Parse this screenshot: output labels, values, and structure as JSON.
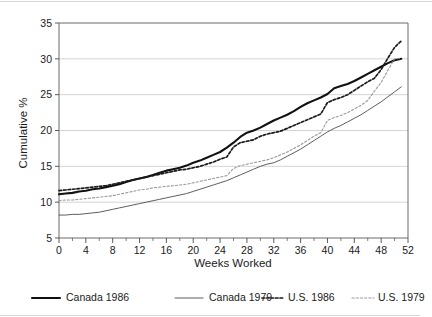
{
  "chart_data": {
    "type": "line",
    "title": "",
    "subtitle": "",
    "xlabel": "Weeks Worked",
    "ylabel": "Cumulative %",
    "xlim": [
      0,
      52
    ],
    "ylim": [
      5,
      35
    ],
    "grid": "horizontal",
    "legend_position": "bottom",
    "x_ticks": [
      0,
      4,
      8,
      12,
      16,
      20,
      24,
      28,
      32,
      36,
      40,
      44,
      48,
      52
    ],
    "x_tick_labels": [
      "0",
      "4",
      "8",
      "12",
      "16",
      "20",
      "24",
      "28",
      "32",
      "36",
      "40",
      "44",
      "48",
      "52"
    ],
    "x_minor_tick_step": 2,
    "y_ticks": [
      5,
      10,
      15,
      20,
      25,
      30,
      35
    ],
    "y_tick_labels": [
      "5",
      "10",
      "15",
      "20",
      "25",
      "30",
      "35"
    ],
    "x": [
      0,
      1,
      2,
      3,
      4,
      5,
      6,
      7,
      8,
      9,
      10,
      11,
      12,
      13,
      14,
      15,
      16,
      17,
      18,
      19,
      20,
      21,
      22,
      23,
      24,
      25,
      26,
      27,
      28,
      29,
      30,
      31,
      32,
      33,
      34,
      35,
      36,
      37,
      38,
      39,
      40,
      41,
      42,
      43,
      44,
      45,
      46,
      47,
      48,
      49,
      50,
      51
    ],
    "series": [
      {
        "name": "Canada 1986",
        "style": "solid-thick",
        "color": "#111111",
        "values": [
          11.1,
          11.2,
          11.3,
          11.5,
          11.6,
          11.8,
          11.9,
          12.1,
          12.3,
          12.5,
          12.8,
          13.1,
          13.3,
          13.5,
          13.8,
          14.1,
          14.4,
          14.6,
          14.8,
          15.1,
          15.5,
          15.8,
          16.2,
          16.6,
          17.0,
          17.6,
          18.3,
          19.1,
          19.7,
          20.0,
          20.4,
          20.9,
          21.4,
          21.8,
          22.2,
          22.7,
          23.3,
          23.8,
          24.2,
          24.6,
          25.1,
          25.9,
          26.2,
          26.5,
          26.9,
          27.4,
          27.9,
          28.4,
          28.9,
          29.4,
          29.8,
          30.0
        ]
      },
      {
        "name": "Canada 1979",
        "style": "solid-thin",
        "color": "#5d5d5d",
        "values": [
          8.2,
          8.2,
          8.3,
          8.3,
          8.4,
          8.5,
          8.6,
          8.8,
          9.0,
          9.2,
          9.4,
          9.6,
          9.8,
          10.0,
          10.2,
          10.4,
          10.6,
          10.8,
          11.0,
          11.2,
          11.5,
          11.8,
          12.1,
          12.4,
          12.7,
          13.0,
          13.4,
          13.8,
          14.2,
          14.6,
          15.0,
          15.3,
          15.5,
          15.9,
          16.4,
          16.9,
          17.4,
          18.0,
          18.6,
          19.2,
          19.8,
          20.3,
          20.7,
          21.2,
          21.7,
          22.2,
          22.8,
          23.4,
          24.0,
          24.7,
          25.4,
          26.1
        ]
      },
      {
        "name": "U.S. 1986",
        "style": "dotted-bold",
        "color": "#1a1a1a",
        "values": [
          11.6,
          11.7,
          11.8,
          11.9,
          12.0,
          12.1,
          12.2,
          12.3,
          12.5,
          12.7,
          12.9,
          13.1,
          13.3,
          13.5,
          13.7,
          13.9,
          14.1,
          14.3,
          14.5,
          14.6,
          14.8,
          15.0,
          15.3,
          15.6,
          16.0,
          16.3,
          17.7,
          18.3,
          18.5,
          18.7,
          19.2,
          19.5,
          19.7,
          19.9,
          20.3,
          20.7,
          21.1,
          21.5,
          21.9,
          22.3,
          23.9,
          24.3,
          24.6,
          25.0,
          25.6,
          26.2,
          26.8,
          27.3,
          28.5,
          30.1,
          31.6,
          32.5
        ]
      },
      {
        "name": "U.S. 1979",
        "style": "dotted-light",
        "color": "#9a9a9a",
        "values": [
          10.2,
          10.3,
          10.3,
          10.4,
          10.5,
          10.6,
          10.7,
          10.8,
          10.9,
          11.1,
          11.3,
          11.5,
          11.7,
          11.8,
          12.0,
          12.1,
          12.2,
          12.3,
          12.4,
          12.5,
          12.7,
          12.9,
          13.1,
          13.3,
          13.5,
          13.7,
          14.7,
          15.1,
          15.3,
          15.5,
          15.7,
          15.9,
          16.2,
          16.6,
          17.0,
          17.5,
          18.0,
          18.6,
          19.2,
          19.7,
          21.4,
          21.8,
          22.1,
          22.5,
          23.0,
          23.5,
          24.2,
          25.5,
          26.7,
          28.4,
          30.0,
          30.1
        ]
      }
    ]
  },
  "legend": {
    "items": [
      {
        "label": "Canada 1986"
      },
      {
        "label": "Canada 1979"
      },
      {
        "label": "U.S. 1986"
      },
      {
        "label": "U.S. 1979"
      }
    ]
  }
}
